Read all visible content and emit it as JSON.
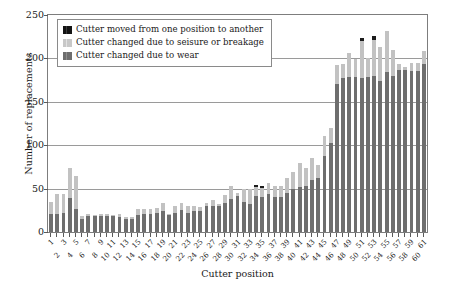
{
  "chart_data": {
    "type": "bar",
    "stacked": true,
    "title": "",
    "xlabel": "Cutter position",
    "ylabel": "Number of replacements",
    "ylim": [
      0,
      250
    ],
    "yticks": [
      0,
      50,
      100,
      150,
      200,
      250
    ],
    "grid": true,
    "legend_position": "upper-left-inside",
    "categories": [
      "1",
      "2",
      "3",
      "4",
      "5",
      "6",
      "7",
      "8",
      "9",
      "10",
      "11",
      "12",
      "13",
      "14",
      "15",
      "16",
      "17",
      "18",
      "19",
      "20",
      "21",
      "22",
      "23",
      "24",
      "25",
      "26",
      "27",
      "28",
      "29",
      "30",
      "31",
      "32",
      "33",
      "34",
      "35",
      "36",
      "37",
      "38",
      "39",
      "40",
      "41",
      "42",
      "43",
      "44",
      "45",
      "46",
      "47",
      "48",
      "49",
      "50",
      "51",
      "52",
      "53",
      "54",
      "55",
      "56",
      "57",
      "58",
      "59",
      "60",
      "61"
    ],
    "series": [
      {
        "name": "Cutter changed due to wear",
        "color": "#6e6e6e",
        "values": [
          21,
          21,
          22,
          39,
          27,
          15,
          19,
          18,
          19,
          19,
          18,
          17,
          15,
          15,
          20,
          21,
          21,
          22,
          24,
          20,
          22,
          25,
          22,
          24,
          24,
          30,
          30,
          30,
          33,
          38,
          41,
          35,
          32,
          42,
          40,
          44,
          40,
          40,
          45,
          50,
          52,
          53,
          60,
          62,
          88,
          103,
          170,
          178,
          179,
          179,
          178,
          179,
          180,
          174,
          184,
          180,
          187,
          187,
          186,
          186,
          193
        ]
      },
      {
        "name": "Cutter changed due to seisure or breakage",
        "color": "#c2c2c2",
        "values": [
          14,
          23,
          22,
          35,
          37,
          4,
          2,
          2,
          2,
          2,
          2,
          4,
          2,
          2,
          7,
          5,
          5,
          6,
          9,
          1,
          8,
          9,
          8,
          6,
          5,
          4,
          7,
          2,
          10,
          15,
          4,
          14,
          17,
          10,
          11,
          12,
          13,
          13,
          17,
          19,
          28,
          21,
          25,
          15,
          23,
          17,
          23,
          15,
          27,
          20,
          42,
          21,
          41,
          39,
          48,
          30,
          7,
          3,
          9,
          9,
          15
        ]
      },
      {
        "name": "Cutter moved from one position to another",
        "color": "#1c1c1c",
        "values": [
          0,
          0,
          0,
          0,
          0,
          0,
          0,
          0,
          0,
          0,
          0,
          0,
          0,
          0,
          0,
          0,
          0,
          0,
          0,
          0,
          0,
          0,
          0,
          0,
          0,
          0,
          0,
          0,
          0,
          0,
          0,
          0,
          0,
          2,
          2,
          0,
          0,
          0,
          0,
          0,
          0,
          0,
          0,
          0,
          0,
          0,
          0,
          0,
          0,
          0,
          4,
          0,
          5,
          0,
          0,
          0,
          0,
          0,
          0,
          0,
          0
        ]
      }
    ]
  },
  "legend": {
    "entries": [
      {
        "label": "Cutter moved from one position to another",
        "swatch": "moved"
      },
      {
        "label": "Cutter changed due to seisure or breakage",
        "swatch": "seisure"
      },
      {
        "label": "Cutter changed due to wear",
        "swatch": "wear"
      }
    ]
  },
  "axes": {
    "y_title": "Number of replacements",
    "x_title": "Cutter position"
  }
}
